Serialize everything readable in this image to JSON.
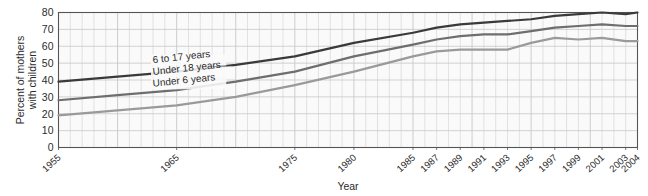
{
  "chart_data": {
    "type": "line",
    "title": "",
    "xlabel": "Year",
    "ylabel": "Percent of mothers with children",
    "ylabel_line1": "Percent of mothers",
    "ylabel_line2": "with children",
    "ylim": [
      0,
      80
    ],
    "yticks": [
      0,
      10,
      20,
      30,
      40,
      50,
      60,
      70,
      80
    ],
    "xlim": [
      1955,
      2004
    ],
    "xticks": [
      1955,
      1965,
      1975,
      1980,
      1985,
      1987,
      1989,
      1991,
      1993,
      1995,
      1997,
      1999,
      2001,
      2003,
      2004
    ],
    "xtick_labels": [
      "1955",
      "1965",
      "1975",
      "1980",
      "1985",
      "1987",
      "1989",
      "1991",
      "1993",
      "1995",
      "1997",
      "1999",
      "2001",
      "2003",
      "2004"
    ],
    "grid": true,
    "grid_x_step": 1,
    "grid_y_step": 10,
    "legend_position": "inline-on-lines",
    "series": [
      {
        "name": "6 to 17 years",
        "color": "#3a3a3a",
        "label_x": 1963,
        "label_y": 50,
        "x": [
          1955,
          1960,
          1965,
          1970,
          1975,
          1980,
          1985,
          1987,
          1989,
          1991,
          1993,
          1995,
          1997,
          1999,
          2001,
          2003,
          2004
        ],
        "values": [
          39,
          42,
          45,
          49,
          54,
          62,
          68,
          71,
          73,
          74,
          75,
          76,
          78,
          79,
          80,
          79,
          80
        ]
      },
      {
        "name": "Under 18 years",
        "color": "#6e6e6e",
        "label_x": 1963,
        "label_y": 43,
        "x": [
          1955,
          1960,
          1965,
          1970,
          1975,
          1980,
          1985,
          1987,
          1989,
          1991,
          1993,
          1995,
          1997,
          1999,
          2001,
          2003,
          2004
        ],
        "values": [
          28,
          31,
          34,
          39,
          45,
          54,
          61,
          64,
          66,
          67,
          67,
          69,
          71,
          72,
          73,
          72,
          72
        ]
      },
      {
        "name": "Under 6 years",
        "color": "#9a9a9a",
        "label_x": 1963,
        "label_y": 36,
        "x": [
          1955,
          1960,
          1965,
          1970,
          1975,
          1980,
          1985,
          1987,
          1989,
          1991,
          1993,
          1995,
          1997,
          1999,
          2001,
          2003,
          2004
        ],
        "values": [
          19,
          22,
          25,
          30,
          37,
          45,
          54,
          57,
          58,
          58,
          58,
          62,
          65,
          64,
          65,
          63,
          63
        ]
      }
    ]
  },
  "colors": {
    "plot_background": "#fafafa",
    "grid": "#c8c8c8",
    "axis": "#555555",
    "text": "#2b2b2b"
  }
}
